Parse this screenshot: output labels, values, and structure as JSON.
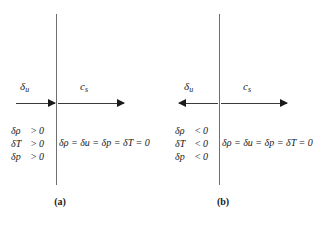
{
  "figure": {
    "type": "physics-diagram"
  },
  "panels": [
    {
      "id": "a",
      "caption": "(a)",
      "arrow_du_label": "δ",
      "arrow_du_sub": "u",
      "arrow_du_direction": "right",
      "arrow_cs_label": "c",
      "arrow_cs_sub": "s",
      "arrow_cs_direction": "right",
      "conditions": [
        {
          "lhs": "δρ",
          "op": ">",
          "rhs": "0"
        },
        {
          "lhs": "δT",
          "op": ">",
          "rhs": "0"
        },
        {
          "lhs": "δp",
          "op": ">",
          "rhs": "0"
        }
      ],
      "equation": "δρ = δu = δp = δT = 0"
    },
    {
      "id": "b",
      "caption": "(b)",
      "arrow_du_label": "δ",
      "arrow_du_sub": "u",
      "arrow_du_direction": "left",
      "arrow_cs_label": "c",
      "arrow_cs_sub": "s",
      "arrow_cs_direction": "right",
      "conditions": [
        {
          "lhs": "δρ",
          "op": "<",
          "rhs": "0"
        },
        {
          "lhs": "δT",
          "op": "<",
          "rhs": "0"
        },
        {
          "lhs": "δp",
          "op": "<",
          "rhs": "0"
        }
      ],
      "equation": "δρ = δu = δp = δT = 0"
    }
  ],
  "colors": {
    "background": "#ffffff",
    "front_line": "#6f6f6f",
    "arrow": "#1a1a1a",
    "text": "#1a1a1a"
  }
}
